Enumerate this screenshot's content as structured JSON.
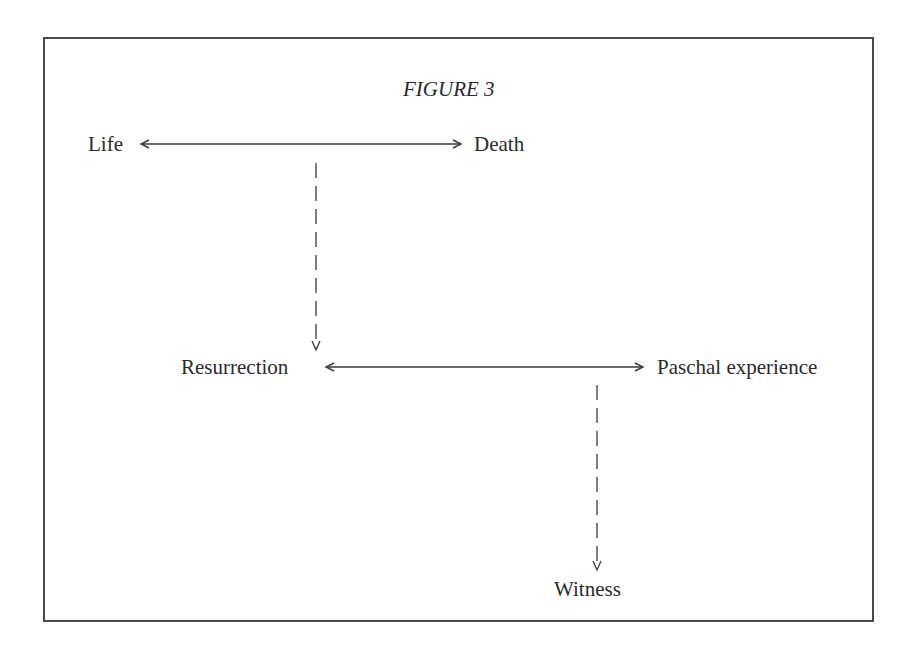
{
  "figure": {
    "title": "FIGURE 3",
    "nodes": {
      "life": "Life",
      "death": "Death",
      "resurrection": "Resurrection",
      "paschal": "Paschal experience",
      "witness": "Witness"
    },
    "edges": [
      {
        "from": "Life",
        "to": "Death",
        "style": "solid",
        "direction": "bidirectional"
      },
      {
        "from": "Life-Death",
        "to": "Resurrection",
        "style": "dashed",
        "direction": "down"
      },
      {
        "from": "Resurrection",
        "to": "Paschal experience",
        "style": "solid",
        "direction": "bidirectional"
      },
      {
        "from": "Resurrection-Paschal experience",
        "to": "Witness",
        "style": "dashed",
        "direction": "down"
      }
    ],
    "colors": {
      "ink": "#2a2a2a",
      "border": "#4a4a4a",
      "background": "#ffffff"
    }
  }
}
